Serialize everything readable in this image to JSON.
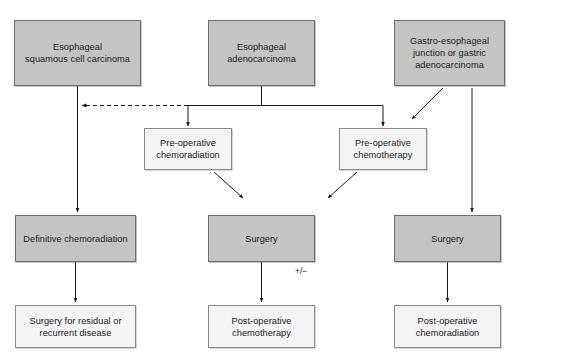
{
  "diagram": {
    "colors": {
      "shaded_fill": "#c4c4c4",
      "plain_fill": "#f4f4f4",
      "border": "#6e6e6e",
      "line": "#1a1a1a",
      "text": "#1a1a1a",
      "background": "#ffffff"
    },
    "nodes": [
      {
        "id": "esophageal-squamous-cell-carcinoma",
        "name": "node-esophageal-squamous-cell-carcinoma",
        "line1": "Esophageal",
        "line2": "squamous cell carcinoma",
        "style": "shaded",
        "x": 14,
        "y": 20,
        "w": 127,
        "h": 66
      },
      {
        "id": "esophageal-adenocarcinoma",
        "name": "node-esophageal-adenocarcinoma",
        "line1": "Esophageal",
        "line2": "adenocarcinoma",
        "style": "shaded",
        "x": 208,
        "y": 20,
        "w": 107,
        "h": 66
      },
      {
        "id": "gastro-esophageal-junction-or-gastric-adenocarcinoma",
        "name": "node-gastro-esophageal-junction-or-gastric-adenocarcinoma",
        "line1": "Gastro-esophageal",
        "line2": "junction or gastric",
        "line3": "adenocarcinoma",
        "style": "shaded",
        "x": 394,
        "y": 20,
        "w": 111,
        "h": 66
      },
      {
        "id": "pre-operative-chemoradiation",
        "name": "node-pre-operative-chemoradiation",
        "line1": "Pre-operative",
        "line2": "chemoradiation",
        "style": "plain",
        "x": 144,
        "y": 128,
        "w": 88,
        "h": 42
      },
      {
        "id": "pre-operative-chemotherapy",
        "name": "node-pre-operative-chemotherapy",
        "line1": "Pre-operative",
        "line2": "chemotherapy",
        "style": "plain",
        "x": 339,
        "y": 128,
        "w": 88,
        "h": 42
      },
      {
        "id": "definitive-chemoradiation",
        "name": "node-definitive-chemoradiation",
        "line1": "Definitive chemoradiation",
        "style": "shaded",
        "x": 15,
        "y": 215,
        "w": 121,
        "h": 47
      },
      {
        "id": "surgery-middle",
        "name": "node-surgery-middle",
        "line1": "Surgery",
        "style": "shaded",
        "x": 208,
        "y": 215,
        "w": 107,
        "h": 47
      },
      {
        "id": "surgery-right",
        "name": "node-surgery-right",
        "line1": "Surgery",
        "style": "shaded",
        "x": 394,
        "y": 215,
        "w": 107,
        "h": 47
      },
      {
        "id": "surgery-for-residual-or-recurrent-disease",
        "name": "node-surgery-for-residual-or-recurrent-disease",
        "line1": "Surgery for residual or",
        "line2": "recurrent disease",
        "style": "plain",
        "x": 15,
        "y": 305,
        "w": 121,
        "h": 43
      },
      {
        "id": "post-operative-chemotherapy",
        "name": "node-post-operative-chemotherapy",
        "line1": "Post-operative",
        "line2": "chemotherapy",
        "style": "plain",
        "x": 208,
        "y": 305,
        "w": 107,
        "h": 43
      },
      {
        "id": "post-operative-chemoradiation",
        "name": "node-post-operative-chemoradiation",
        "line1": "Post-operative",
        "line2": "chemoradiation",
        "style": "plain",
        "x": 394,
        "y": 305,
        "w": 107,
        "h": 43
      }
    ],
    "edge_labels": [
      {
        "id": "plus-minus",
        "name": "edge-label-plus-minus",
        "text": "+/−",
        "x": 295,
        "y": 266
      }
    ],
    "edges": [
      {
        "id": "adeno-to-chemoradiation",
        "from": "esophageal-adenocarcinoma",
        "to": "pre-operative-chemoradiation",
        "style": "solid"
      },
      {
        "id": "adeno-to-chemotherapy",
        "from": "esophageal-adenocarcinoma",
        "to": "pre-operative-chemotherapy",
        "style": "solid"
      },
      {
        "id": "adeno-to-squamous-branch",
        "from": "esophageal-adenocarcinoma",
        "to": "definitive-chemoradiation",
        "style": "dashed"
      },
      {
        "id": "squamous-to-definitive-chemoradiation",
        "from": "esophageal-squamous-cell-carcinoma",
        "to": "definitive-chemoradiation",
        "style": "solid"
      },
      {
        "id": "gej-to-chemotherapy",
        "from": "gastro-esophageal-junction-or-gastric-adenocarcinoma",
        "to": "pre-operative-chemotherapy",
        "style": "solid"
      },
      {
        "id": "gej-to-surgery-right",
        "from": "gastro-esophageal-junction-or-gastric-adenocarcinoma",
        "to": "surgery-right",
        "style": "solid"
      },
      {
        "id": "chemoradiation-to-surgery-middle",
        "from": "pre-operative-chemoradiation",
        "to": "surgery-middle",
        "style": "solid"
      },
      {
        "id": "chemotherapy-to-surgery-middle",
        "from": "pre-operative-chemotherapy",
        "to": "surgery-middle",
        "style": "solid"
      },
      {
        "id": "definitive-to-residual-surgery",
        "from": "definitive-chemoradiation",
        "to": "surgery-for-residual-or-recurrent-disease",
        "style": "solid"
      },
      {
        "id": "surgery-middle-to-post-op-chemo",
        "from": "surgery-middle",
        "to": "post-operative-chemotherapy",
        "style": "solid",
        "label": "+/−"
      },
      {
        "id": "surgery-right-to-post-op-chemoradiation",
        "from": "surgery-right",
        "to": "post-operative-chemoradiation",
        "style": "solid"
      }
    ]
  }
}
